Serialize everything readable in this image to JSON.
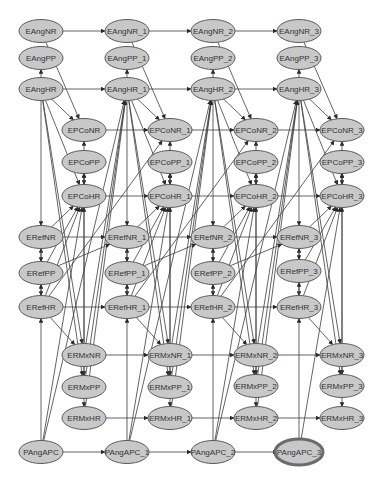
{
  "graph": {
    "title": "Dynamic Bayesian network",
    "selected_node": "PAngAPC_3",
    "colors": {
      "node_fill": "#c8c8c8",
      "node_stroke": "#5a5a5a",
      "edge": "#3c3c3c",
      "background": "#ffffff"
    },
    "nodes": [
      {
        "id": "EAngNR",
        "label": "EAngNR",
        "col": 0,
        "row": "EAngNR"
      },
      {
        "id": "EAngPP",
        "label": "EAngPP",
        "col": 0,
        "row": "EAngPP"
      },
      {
        "id": "EAngHR",
        "label": "EAngHR",
        "col": 0,
        "row": "EAngHR"
      },
      {
        "id": "EPCoNR",
        "label": "EPCoNR",
        "col": 0,
        "row": "EPCoNR"
      },
      {
        "id": "EPCoPP",
        "label": "EPCoPP",
        "col": 0,
        "row": "EPCoPP"
      },
      {
        "id": "EPCoHR",
        "label": "EPCoHR",
        "col": 0,
        "row": "EPCoHR"
      },
      {
        "id": "ERefNR",
        "label": "ERefNR",
        "col": 0,
        "row": "ERefNR"
      },
      {
        "id": "ERefPP",
        "label": "ERefPP",
        "col": 0,
        "row": "ERefPP"
      },
      {
        "id": "ERefHR",
        "label": "ERefHR",
        "col": 0,
        "row": "ERefHR"
      },
      {
        "id": "ERMxNR",
        "label": "ERMxNR",
        "col": 0,
        "row": "ERMxNR"
      },
      {
        "id": "ERMxPP",
        "label": "ERMxPP",
        "col": 0,
        "row": "ERMxPP"
      },
      {
        "id": "ERMxHR",
        "label": "ERMxHR",
        "col": 0,
        "row": "ERMxHR"
      },
      {
        "id": "PAngAPC",
        "label": "PAngAPC",
        "col": 0,
        "row": "PAngAPC"
      },
      {
        "id": "EAngNR_1",
        "label": "EAngNR_1",
        "col": 1,
        "row": "EAngNR"
      },
      {
        "id": "EAngPP_1",
        "label": "EAngPP_1",
        "col": 1,
        "row": "EAngPP"
      },
      {
        "id": "EAngHR_1",
        "label": "EAngHR_1",
        "col": 1,
        "row": "EAngHR"
      },
      {
        "id": "EPCoNR_1",
        "label": "EPCoNR_1",
        "col": 1,
        "row": "EPCoNR"
      },
      {
        "id": "EPCoPP_1",
        "label": "EPCoPP_1",
        "col": 1,
        "row": "EPCoPP"
      },
      {
        "id": "EPCoHR_1",
        "label": "EPCoHR_1",
        "col": 1,
        "row": "EPCoHR"
      },
      {
        "id": "ERefNR_1",
        "label": "ERefNR_1",
        "col": 1,
        "row": "ERefNR"
      },
      {
        "id": "ERefPP_1",
        "label": "ERefPP_1",
        "col": 1,
        "row": "ERefPP"
      },
      {
        "id": "ERefHR_1",
        "label": "ERefHR_1",
        "col": 1,
        "row": "ERefHR"
      },
      {
        "id": "ERMxNR_1",
        "label": "ERMxNR_1",
        "col": 1,
        "row": "ERMxNR"
      },
      {
        "id": "ERMxPP_1",
        "label": "ERMxPP_1",
        "col": 1,
        "row": "ERMxPP"
      },
      {
        "id": "ERMxHR_1",
        "label": "ERMxHR_1",
        "col": 1,
        "row": "ERMxHR"
      },
      {
        "id": "PAngAPC_1",
        "label": "PAngAPC_1",
        "col": 1,
        "row": "PAngAPC"
      },
      {
        "id": "EAngNR_2",
        "label": "EAngNR_2",
        "col": 2,
        "row": "EAngNR"
      },
      {
        "id": "EAngPP_2",
        "label": "EAngPP_2",
        "col": 2,
        "row": "EAngPP"
      },
      {
        "id": "EAngHR_2",
        "label": "EAngHR_2",
        "col": 2,
        "row": "EAngHR"
      },
      {
        "id": "EPCoNR_2",
        "label": "EPCoNR_2",
        "col": 2,
        "row": "EPCoNR"
      },
      {
        "id": "EPCoPP_2",
        "label": "EPCoPP_2",
        "col": 2,
        "row": "EPCoPP"
      },
      {
        "id": "EPCoHR_2",
        "label": "EPCoHR_2",
        "col": 2,
        "row": "EPCoHR"
      },
      {
        "id": "ERefNR_2",
        "label": "ERefNR_2",
        "col": 2,
        "row": "ERefNR"
      },
      {
        "id": "ERefPP_2",
        "label": "ERefPP_2",
        "col": 2,
        "row": "ERefPP"
      },
      {
        "id": "ERefHR_2",
        "label": "ERefHR_2",
        "col": 2,
        "row": "ERefHR"
      },
      {
        "id": "ERMxNR_2",
        "label": "ERMxNR_2",
        "col": 2,
        "row": "ERMxNR"
      },
      {
        "id": "ERMxPP_2",
        "label": "ERMxPP_2",
        "col": 2,
        "row": "ERMxPP"
      },
      {
        "id": "ERMxHR_2",
        "label": "ERMxHR_2",
        "col": 2,
        "row": "ERMxHR"
      },
      {
        "id": "PAngAPC_2",
        "label": "PAngAPC_2",
        "col": 2,
        "row": "PAngAPC"
      },
      {
        "id": "EAngNR_3",
        "label": "EAngNR_3",
        "col": 3,
        "row": "EAngNR"
      },
      {
        "id": "EAngPP_3",
        "label": "EAngPP_3",
        "col": 3,
        "row": "EAngPP"
      },
      {
        "id": "EAngHR_3",
        "label": "EAngHR_3",
        "col": 3,
        "row": "EAngHR"
      },
      {
        "id": "EPCoNR_3",
        "label": "EPCoNR_3",
        "col": 3,
        "row": "EPCoNR"
      },
      {
        "id": "EPCoPP_3",
        "label": "EPCoPP_3",
        "col": 3,
        "row": "EPCoPP"
      },
      {
        "id": "EPCoHR_3",
        "label": "EPCoHR_3",
        "col": 3,
        "row": "EPCoHR"
      },
      {
        "id": "ERefNR_3",
        "label": "ERefNR_3",
        "col": 3,
        "row": "ERefNR"
      },
      {
        "id": "ERefPP_3",
        "label": "ERefPP_3",
        "col": 3,
        "row": "ERefPP"
      },
      {
        "id": "ERefHR_3",
        "label": "ERefHR_3",
        "col": 3,
        "row": "ERefHR"
      },
      {
        "id": "ERMxNR_3",
        "label": "ERMxNR_3",
        "col": 3,
        "row": "ERMxNR"
      },
      {
        "id": "ERMxPP_3",
        "label": "ERMxPP_3",
        "col": 3,
        "row": "ERMxPP"
      },
      {
        "id": "ERMxHR_3",
        "label": "ERMxHR_3",
        "col": 3,
        "row": "ERMxHR"
      },
      {
        "id": "PAngAPC_3",
        "label": "PAngAPC_3",
        "col": 3,
        "row": "PAngAPC"
      }
    ],
    "temporal_edges": [
      "EAngNR",
      "EAngHR",
      "EPCoNR",
      "EPCoHR",
      "ERefNR",
      "ERefHR",
      "ERMxNR",
      "ERMxHR",
      "PAngAPC"
    ],
    "intra_slice_edges": [
      [
        "EAngHR",
        "EAngPP"
      ],
      [
        "EPCoPP",
        "EPCoNR"
      ],
      [
        "EPCoHR",
        "EPCoPP"
      ],
      [
        "EPCoPP",
        "EPCoHR"
      ],
      [
        "ERefPP",
        "ERefNR"
      ],
      [
        "ERefNR",
        "ERefPP"
      ],
      [
        "ERefPP",
        "ERefHR"
      ],
      [
        "ERefHR",
        "ERefPP"
      ],
      [
        "ERMxNR",
        "ERMxPP"
      ],
      [
        "ERMxPP",
        "ERMxHR"
      ],
      [
        "EAngHR",
        "EPCoNR"
      ],
      [
        "EAngHR",
        "EPCoHR"
      ],
      [
        "EAngHR",
        "ERMxNR"
      ],
      [
        "EAngHR",
        "ERMxPP"
      ],
      [
        "EAngHR",
        "ERefNR"
      ],
      [
        "EAngNR",
        "EPCoNR"
      ],
      [
        "ERefNR",
        "EPCoHR"
      ],
      [
        "ERefPP",
        "EPCoHR"
      ],
      [
        "ERefHR",
        "EPCoHR"
      ],
      [
        "ERMxNR",
        "EPCoPP"
      ],
      [
        "ERMxPP",
        "EPCoHR"
      ],
      [
        "ERefHR",
        "ERMxNR"
      ],
      [
        "PAngAPC",
        "ERefHR"
      ],
      [
        "PAngAPC",
        "EPCoHR"
      ]
    ],
    "cross_slice_edges": [
      [
        "ERefPP",
        "ERefNR_next"
      ],
      [
        "ERMxNR",
        "EAngHR_next"
      ],
      [
        "ERMxPP",
        "EAngHR_next"
      ],
      [
        "ERMxHR",
        "EAngHR_next"
      ],
      [
        "ERefHR",
        "EPCoNR_next"
      ],
      [
        "PAngAPC",
        "EAngHR_next"
      ]
    ]
  }
}
